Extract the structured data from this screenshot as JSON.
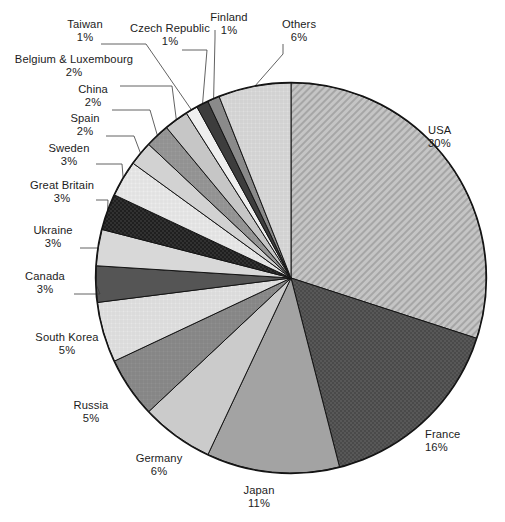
{
  "figure": {
    "title": "",
    "caption_fragment": "",
    "background_color": "#ffffff",
    "outline_color": "#1a1a1a"
  },
  "chart_data": {
    "type": "pie",
    "title": "",
    "xlabel": "",
    "ylabel": "",
    "legend_position": "callout-labels",
    "grid": false,
    "start_angle_deg": 0,
    "direction": "clockwise",
    "unit": "%",
    "categories": [
      "USA",
      "France",
      "Japan",
      "Germany",
      "Russia",
      "South Korea",
      "Canada",
      "Ukraine",
      "Great Britain",
      "Sweden",
      "Spain",
      "China",
      "Belgium & Luxembourg",
      "Taiwan",
      "Czech Republic",
      "Finland",
      "Others"
    ],
    "values": [
      30,
      16,
      11,
      6,
      5,
      5,
      3,
      3,
      3,
      3,
      2,
      2,
      2,
      1,
      1,
      1,
      6
    ],
    "value_labels": [
      "30%",
      "16%",
      "11%",
      "6%",
      "5%",
      "5%",
      "3%",
      "3%",
      "3%",
      "3%",
      "2%",
      "2%",
      "2%",
      "1%",
      "1%",
      "1%",
      "6%"
    ],
    "slice_styles": [
      {
        "name": "USA",
        "fill": "#b9b9b9",
        "pattern": "diagonal-hatch"
      },
      {
        "name": "France",
        "fill": "#4a4a4a",
        "pattern": "dots"
      },
      {
        "name": "Japan",
        "fill": "#a3a3a3",
        "pattern": "solid"
      },
      {
        "name": "Germany",
        "fill": "#cbcbcb",
        "pattern": "solid"
      },
      {
        "name": "Russia",
        "fill": "#8e8e8e",
        "pattern": "crosshatch"
      },
      {
        "name": "South Korea",
        "fill": "#e2e2e2",
        "pattern": "crosshatch"
      },
      {
        "name": "Canada",
        "fill": "#555555",
        "pattern": "solid"
      },
      {
        "name": "Ukraine",
        "fill": "#d8d8d8",
        "pattern": "solid"
      },
      {
        "name": "Great Britain",
        "fill": "#1f1f1f",
        "pattern": "dots"
      },
      {
        "name": "Sweden",
        "fill": "#ececec",
        "pattern": "crosshatch"
      },
      {
        "name": "Spain",
        "fill": "#d2d2d2",
        "pattern": "solid"
      },
      {
        "name": "China",
        "fill": "#9a9a9a",
        "pattern": "crosshatch"
      },
      {
        "name": "Belgium & Luxembourg",
        "fill": "#c6c6c6",
        "pattern": "solid"
      },
      {
        "name": "Taiwan",
        "fill": "#efefef",
        "pattern": "solid"
      },
      {
        "name": "Czech Republic",
        "fill": "#3d3d3d",
        "pattern": "solid"
      },
      {
        "name": "Finland",
        "fill": "#8a8a8a",
        "pattern": "solid"
      },
      {
        "name": "Others",
        "fill": "#dcdcdc",
        "pattern": "crosshatch"
      }
    ]
  },
  "labels": {
    "usa": {
      "name": "USA",
      "pct": "30%"
    },
    "france": {
      "name": "France",
      "pct": "16%"
    },
    "japan": {
      "name": "Japan",
      "pct": "11%"
    },
    "germany": {
      "name": "Germany",
      "pct": "6%"
    },
    "russia": {
      "name": "Russia",
      "pct": "5%"
    },
    "south_korea": {
      "name": "South Korea",
      "pct": "5%"
    },
    "canada": {
      "name": "Canada",
      "pct": "3%"
    },
    "ukraine": {
      "name": "Ukraine",
      "pct": "3%"
    },
    "great_britain": {
      "name": "Great Britain",
      "pct": "3%"
    },
    "sweden": {
      "name": "Sweden",
      "pct": "3%"
    },
    "spain": {
      "name": "Spain",
      "pct": "2%"
    },
    "china": {
      "name": "China",
      "pct": "2%"
    },
    "belgium_luxembourg": {
      "name": "Belgium & Luxembourg",
      "pct": "2%"
    },
    "taiwan": {
      "name": "Taiwan",
      "pct": "1%"
    },
    "czech_republic": {
      "name": "Czech Republic",
      "pct": "1%"
    },
    "finland": {
      "name": "Finland",
      "pct": "1%"
    },
    "others": {
      "name": "Others",
      "pct": "6%"
    }
  }
}
